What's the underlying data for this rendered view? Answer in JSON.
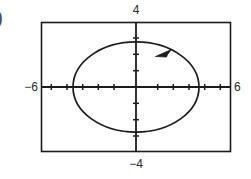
{
  "figure": {
    "part_label": ")",
    "caption": "",
    "stroke_color": "#1c1c1c",
    "background_color": "#ffffff"
  },
  "labels": {
    "top": "4",
    "bottom": "−4",
    "left": "−6",
    "right": "6"
  },
  "chart_data": {
    "type": "line",
    "title": "",
    "xlabel": "",
    "ylabel": "",
    "xlim": [
      -6,
      6
    ],
    "ylim": [
      -4,
      4
    ],
    "xticks": [
      -5,
      -4,
      -3,
      -2,
      -1,
      1,
      2,
      3,
      4,
      5
    ],
    "yticks": [
      -3,
      -2,
      -1,
      1,
      2,
      3
    ],
    "xtick_labels": [
      "-6",
      "6"
    ],
    "ytick_labels": [
      "4",
      "-4"
    ],
    "grid": false,
    "legend": "none",
    "frame": true,
    "curve": {
      "name": "ellipse",
      "shape": "ellipse",
      "center": [
        0,
        0
      ],
      "semi_axis_x": 4,
      "semi_axis_y": 2.8,
      "closed": true,
      "direction": "counterclockwise",
      "arrow_at_parameter_deg": 40,
      "x": [
        4,
        3.83,
        3.35,
        2.59,
        1.64,
        0.59,
        -0.48,
        -1.49,
        -2.36,
        -3.06,
        -3.57,
        -3.88,
        -4,
        -3.88,
        -3.57,
        -3.06,
        -2.36,
        -1.49,
        -0.48,
        0.59,
        1.64,
        2.59,
        3.35,
        3.83,
        4
      ],
      "y": [
        0,
        0.73,
        1.4,
        1.97,
        2.4,
        2.68,
        2.78,
        2.69,
        2.43,
        2.02,
        1.46,
        0.82,
        0,
        -0.82,
        -1.46,
        -2.02,
        -2.43,
        -2.69,
        -2.78,
        -2.68,
        -2.4,
        -1.97,
        -1.4,
        -0.73,
        0
      ]
    }
  }
}
